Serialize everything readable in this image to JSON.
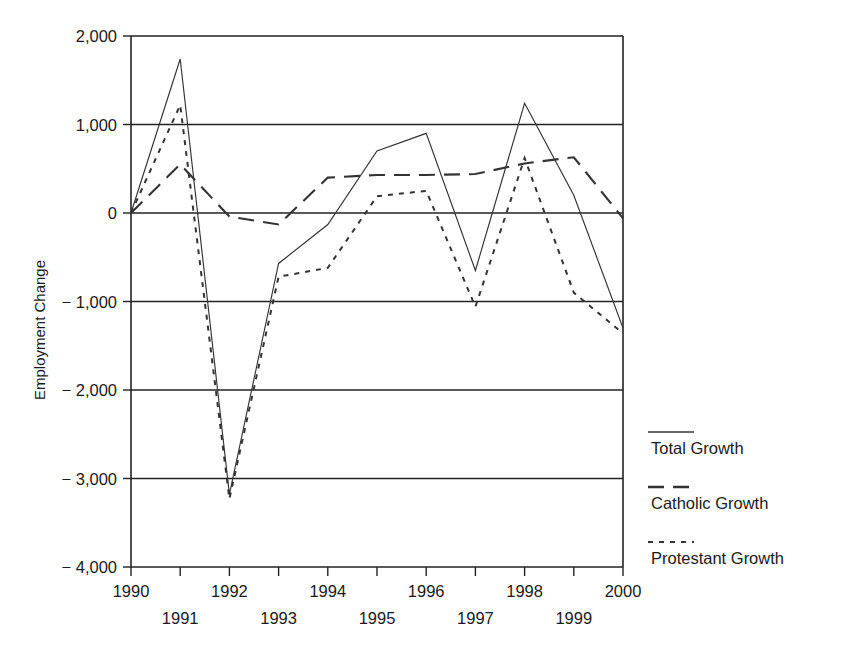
{
  "chart_data": {
    "type": "line",
    "title": "",
    "xlabel": "",
    "ylabel": "Employment Change",
    "x": [
      1990,
      1991,
      1992,
      1993,
      1994,
      1995,
      1996,
      1997,
      1998,
      1999,
      2000
    ],
    "xtick_labels": [
      "1990",
      "1991",
      "1992",
      "1993",
      "1994",
      "1995",
      "1996",
      "1997",
      "1998",
      "1999",
      "2000"
    ],
    "ytick_labels": [
      "2,000",
      "1,000",
      "0",
      "− 1,000",
      "− 2,000",
      "− 3,000",
      "− 4,000"
    ],
    "ytick_values": [
      2000,
      1000,
      0,
      -1000,
      -2000,
      -3000,
      -4000
    ],
    "xlim": [
      1990,
      2000
    ],
    "ylim": [
      -4000,
      2000
    ],
    "grid": "horizontal",
    "legend_position": "right",
    "series": [
      {
        "name": "Total Growth",
        "style": "solid",
        "values": [
          0,
          1740,
          -3180,
          -570,
          -130,
          700,
          900,
          -650,
          1240,
          200,
          -1300
        ]
      },
      {
        "name": "Catholic Growth",
        "style": "dashed",
        "values": [
          0,
          550,
          -40,
          -130,
          400,
          430,
          430,
          440,
          560,
          630,
          -60
        ]
      },
      {
        "name": "Protestant Growth",
        "style": "dotted",
        "values": [
          0,
          1220,
          -3230,
          -720,
          -620,
          190,
          250,
          -1060,
          620,
          -900,
          -1360
        ]
      }
    ]
  },
  "legend": {
    "items": [
      {
        "label": "Total Growth",
        "style": "solid"
      },
      {
        "label": "Catholic Growth",
        "style": "dashed"
      },
      {
        "label": "Protestant Growth",
        "style": "dotted"
      }
    ]
  },
  "colors": {
    "line": "#333333",
    "axis": "#222222",
    "background": "#ffffff"
  }
}
